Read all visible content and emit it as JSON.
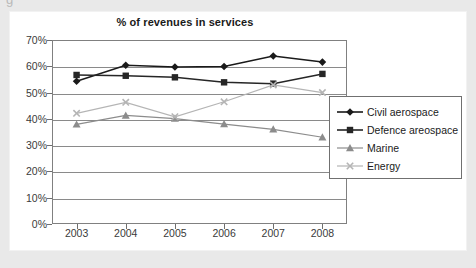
{
  "page_fragment": "g",
  "chart_data": {
    "type": "line",
    "title": "% of revenues in services",
    "xlabel": "",
    "ylabel": "",
    "categories": [
      "2003",
      "2004",
      "2005",
      "2006",
      "2007",
      "2008"
    ],
    "ylim": [
      0,
      70
    ],
    "ytick_labels": [
      "0%",
      "10%",
      "20%",
      "30%",
      "40%",
      "50%",
      "60%",
      "70%"
    ],
    "ytick_values": [
      0,
      10,
      20,
      30,
      40,
      50,
      60,
      70
    ],
    "grid": true,
    "legend_position": "right",
    "series": [
      {
        "name": "Civil aerospace",
        "marker": "diamond",
        "color": "#1a1a1a",
        "values": [
          54.3,
          60.4,
          59.7,
          59.9,
          63.9,
          61.6
        ]
      },
      {
        "name": "Defence areospace",
        "marker": "square",
        "color": "#262626",
        "values": [
          56.7,
          56.4,
          55.8,
          53.9,
          53.4,
          57.1
        ]
      },
      {
        "name": "Marine",
        "marker": "triangle",
        "color": "#8c8c8c",
        "values": [
          37.9,
          41.3,
          40.1,
          38.0,
          36.0,
          33.0
        ]
      },
      {
        "name": "Energy",
        "marker": "x",
        "color": "#b5b5b5",
        "values": [
          42.1,
          46.3,
          40.8,
          46.5,
          52.9,
          50.0
        ]
      }
    ]
  },
  "colors": {
    "background": "#e9e9e9",
    "card": "#ffffff",
    "frame": "#808080",
    "grid": "#8a8a8a",
    "text": "#1a1a1a"
  }
}
